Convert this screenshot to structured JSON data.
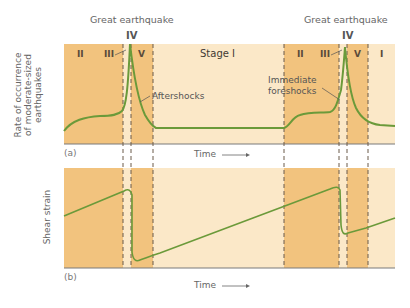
{
  "figure": {
    "panel_a": {
      "label": "(a)",
      "ylabel_lines": [
        "Rate of occurrence",
        "of moderate-sized",
        "earthquakes"
      ],
      "xlabel": "Time",
      "top_labels": [
        {
          "title": "Great earthquake",
          "stage": "IV"
        },
        {
          "title": "Great earthquake",
          "stage": "IV"
        }
      ],
      "stage_labels": [
        "II",
        "III",
        "V",
        "Stage I",
        "II",
        "III",
        "V",
        "I"
      ],
      "annotations": {
        "aftershocks": "Aftershocks",
        "foreshocks_line1": "Immediate",
        "foreshocks_line2": "foreshocks"
      }
    },
    "panel_b": {
      "label": "(b)",
      "ylabel": "Shear strain",
      "xlabel": "Time"
    },
    "colors": {
      "dark_band": "#f2c37e",
      "light_band": "#fbe8c8",
      "curve": "#6b9a3a",
      "axis": "#7a7a7a",
      "dashed": "#6a5a4a"
    }
  }
}
